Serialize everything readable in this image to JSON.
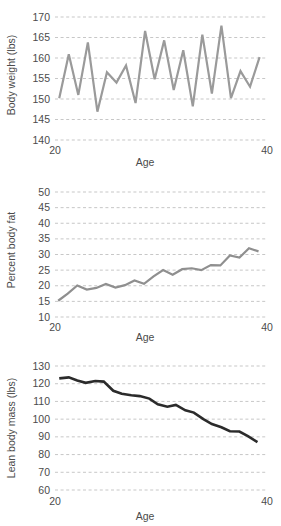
{
  "figure": {
    "credit": "© Cengage Learning",
    "background": "#ffffff",
    "panel_count": 3
  },
  "chart_data": [
    {
      "type": "line",
      "title": "",
      "xlabel": "Age",
      "ylabel": "Body weight (lbs)",
      "xlim": [
        20,
        40
      ],
      "ylim": [
        140,
        170
      ],
      "xticks": [
        20,
        40
      ],
      "xticklabels": [
        "20",
        "40"
      ],
      "yticks": [
        140,
        145,
        150,
        155,
        160,
        165,
        170
      ],
      "yticklabels": [
        "140",
        "145",
        "150",
        "155",
        "160",
        "165",
        "170"
      ],
      "grid": true,
      "grid_axis": "y",
      "legend": "none",
      "line_color": "#9a9a9a",
      "line_width": 2.2,
      "x": [
        20.4,
        21.3,
        22.2,
        23.1,
        24.0,
        24.9,
        25.8,
        26.7,
        27.6,
        28.5,
        29.4,
        30.3,
        31.2,
        32.1,
        33.0,
        33.9,
        34.8,
        35.7,
        36.6,
        37.5,
        38.4,
        39.3
      ],
      "y": [
        150.2,
        160.9,
        151.0,
        163.8,
        146.9,
        156.5,
        154.0,
        158.2,
        149.0,
        166.6,
        154.8,
        164.3,
        152.2,
        161.9,
        148.2,
        165.7,
        151.3,
        167.9,
        150.2,
        156.8,
        153.0,
        160.2
      ]
    },
    {
      "type": "line",
      "title": "",
      "xlabel": "Age",
      "ylabel": "Percent body fat",
      "xlim": [
        20,
        40
      ],
      "ylim": [
        10,
        50
      ],
      "xticks": [
        20,
        40
      ],
      "xticklabels": [
        "20",
        "40"
      ],
      "yticks": [
        10,
        15,
        20,
        25,
        30,
        35,
        40,
        45,
        50
      ],
      "yticklabels": [
        "10",
        "15",
        "20",
        "25",
        "30",
        "35",
        "40",
        "45",
        "50"
      ],
      "grid": true,
      "grid_axis": "y",
      "legend": "none",
      "line_color": "#8f8f8f",
      "line_width": 2.2,
      "x": [
        20.3,
        21.2,
        22.1,
        23.0,
        23.9,
        24.8,
        25.7,
        26.6,
        27.5,
        28.4,
        29.3,
        30.2,
        31.1,
        32.0,
        32.9,
        33.8,
        34.7,
        35.6,
        36.5,
        37.4,
        38.3,
        39.2
      ],
      "y": [
        15.2,
        17.5,
        20.1,
        18.8,
        19.3,
        20.6,
        19.4,
        20.2,
        21.7,
        20.6,
        23.0,
        25.0,
        23.5,
        25.3,
        25.6,
        25.0,
        26.6,
        26.5,
        29.7,
        29.0,
        32.0,
        31.0
      ]
    },
    {
      "type": "line",
      "title": "",
      "xlabel": "Age",
      "ylabel": "Lean body mass (lbs)",
      "xlim": [
        20,
        40
      ],
      "ylim": [
        60,
        130
      ],
      "xticks": [
        20,
        40
      ],
      "xticklabels": [
        "20",
        "40"
      ],
      "yticks": [
        60,
        70,
        80,
        90,
        100,
        110,
        120,
        130
      ],
      "yticklabels": [
        "60",
        "70",
        "80",
        "90",
        "100",
        "110",
        "120",
        "130"
      ],
      "grid": true,
      "grid_axis": "y",
      "legend": "none",
      "line_color": "#2b2b2b",
      "line_width": 2.6,
      "x": [
        20.4,
        21.3,
        22.1,
        22.9,
        23.8,
        24.6,
        25.5,
        26.3,
        27.2,
        28.0,
        28.9,
        29.7,
        30.6,
        31.4,
        32.3,
        33.1,
        34.0,
        34.8,
        35.7,
        36.5,
        37.4,
        38.2,
        39.1
      ],
      "y": [
        123.0,
        123.6,
        121.8,
        120.5,
        121.5,
        121.2,
        116.0,
        114.3,
        113.5,
        113.0,
        111.6,
        108.4,
        107.0,
        108.0,
        105.0,
        103.7,
        100.0,
        97.2,
        95.4,
        93.2,
        93.0,
        90.4,
        87.0
      ]
    }
  ]
}
